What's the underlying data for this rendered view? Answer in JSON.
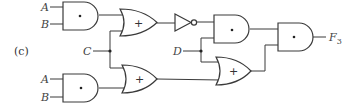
{
  "diagram": {
    "part_label": "(c)",
    "inputs": {
      "top_a": "A",
      "top_b": "B",
      "c": "C",
      "d": "D",
      "bottom_a": "A",
      "bottom_b": "B"
    },
    "output": {
      "name": "F",
      "subscript": "3"
    },
    "gates": [
      {
        "id": "and1",
        "type": "AND",
        "symbol": "•",
        "inputs": [
          "A",
          "B"
        ]
      },
      {
        "id": "or1",
        "type": "OR",
        "symbol": "+",
        "inputs": [
          "and1",
          "C"
        ]
      },
      {
        "id": "not1",
        "type": "NOT",
        "inputs": [
          "or1"
        ]
      },
      {
        "id": "and2",
        "type": "AND",
        "symbol": "•",
        "inputs": [
          "not1",
          "D"
        ]
      },
      {
        "id": "and4",
        "type": "AND",
        "symbol": "•",
        "inputs": [
          "A",
          "B"
        ]
      },
      {
        "id": "or2",
        "type": "OR",
        "symbol": "+",
        "inputs": [
          "C",
          "and4"
        ]
      },
      {
        "id": "or3",
        "type": "OR",
        "symbol": "+",
        "inputs": [
          "D",
          "or2"
        ]
      },
      {
        "id": "and3",
        "type": "AND",
        "symbol": "•",
        "inputs": [
          "and2",
          "or3"
        ],
        "output": "F3"
      }
    ],
    "symbols": {
      "and": "•",
      "or": "+"
    }
  }
}
